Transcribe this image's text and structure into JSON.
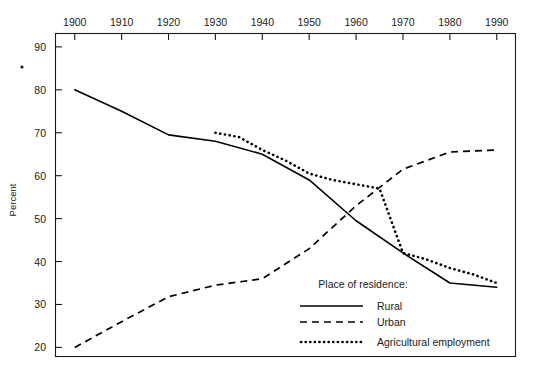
{
  "chart_data": {
    "type": "line",
    "title": "",
    "xlabel": "",
    "ylabel": "Percent",
    "xlim": [
      1896,
      1994
    ],
    "ylim": [
      18,
      93
    ],
    "grid": false,
    "legend_position": "bottom-right",
    "legend_title": "Place of residence:",
    "x_ticks": [
      1900,
      1910,
      1920,
      1930,
      1940,
      1950,
      1960,
      1970,
      1980,
      1990
    ],
    "x_tick_labels": [
      "1900",
      "1910",
      "1920",
      "1930",
      "1940",
      "1950",
      "1960",
      "1970",
      "1980",
      "1990"
    ],
    "x_axis_position": "top",
    "y_ticks": [
      20,
      30,
      40,
      50,
      60,
      70,
      80,
      90
    ],
    "y_tick_labels": [
      "20",
      "30",
      "40",
      "50",
      "60",
      "70",
      "80",
      "90"
    ],
    "series": [
      {
        "name": "Rural",
        "style": "solid",
        "x": [
          1900,
          1910,
          1920,
          1930,
          1940,
          1950,
          1960,
          1970,
          1980,
          1990
        ],
        "values": [
          80.0,
          75.0,
          69.5,
          68.0,
          65.0,
          59.0,
          49.5,
          42.0,
          35.0,
          34.0
        ]
      },
      {
        "name": "Urban",
        "style": "dashed",
        "x": [
          1900,
          1910,
          1920,
          1930,
          1940,
          1950,
          1960,
          1970,
          1980,
          1990
        ],
        "values": [
          20.0,
          26.0,
          31.8,
          34.5,
          36.0,
          43.0,
          53.0,
          61.5,
          65.5,
          66.0
        ]
      },
      {
        "name": "Agricultural employment",
        "style": "dotted",
        "x": [
          1930,
          1935,
          1940,
          1945,
          1950,
          1955,
          1960,
          1965,
          1970,
          1975,
          1980,
          1985,
          1990
        ],
        "values": [
          70.0,
          69.0,
          66.0,
          63.5,
          60.5,
          59.0,
          58.0,
          57.0,
          42.0,
          40.5,
          38.5,
          37.0,
          35.0
        ]
      }
    ]
  },
  "legend": {
    "title": "Place of residence:",
    "entries": [
      {
        "label": "Rural",
        "style": "solid"
      },
      {
        "label": "Urban",
        "style": "dashed"
      },
      {
        "label": "Agricultural employment",
        "style": "dotted"
      }
    ]
  },
  "axes": {
    "y_title": "Percent"
  }
}
